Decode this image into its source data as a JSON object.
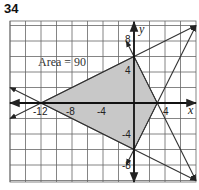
{
  "problem_number": "34",
  "chart_data": {
    "type": "line",
    "title": "",
    "annotation": "Area = 90",
    "xlabel": "x",
    "ylabel": "y",
    "xlim": [
      -16,
      8
    ],
    "ylim": [
      -10,
      10
    ],
    "grid": true,
    "grid_step": 2,
    "x_tick_labels": [
      "-12",
      "-8",
      "-4",
      "4"
    ],
    "y_tick_labels": [
      "8",
      "4",
      "-4",
      "-8"
    ],
    "shaded_region": {
      "vertices": [
        [
          -12,
          0
        ],
        [
          0,
          6
        ],
        [
          3,
          0
        ],
        [
          0,
          -6
        ]
      ],
      "fill": "#c8c8c8",
      "area": 90
    },
    "lines": [
      {
        "name": "line through (-12,0) and (0,6)",
        "points": [
          [
            -16,
            -2
          ],
          [
            8,
            10
          ]
        ]
      },
      {
        "name": "line through (-12,0) and (0,-6)",
        "points": [
          [
            -16,
            2
          ],
          [
            8,
            -10
          ]
        ]
      },
      {
        "name": "line through (0,6) and (3,0)",
        "points": [
          [
            -1,
            8
          ],
          [
            8,
            -10
          ]
        ]
      },
      {
        "name": "line through (0,-6) and (3,0)",
        "points": [
          [
            -1,
            -8
          ],
          [
            8,
            10
          ]
        ]
      }
    ]
  }
}
